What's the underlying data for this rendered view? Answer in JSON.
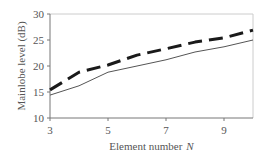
{
  "chart_data": {
    "type": "line",
    "title": "",
    "xlabel": "Element number",
    "xlabel_var": "N",
    "ylabel": "Mainlobe level (dB)",
    "xlim": [
      3,
      10
    ],
    "ylim": [
      10,
      30
    ],
    "xticks": [
      3,
      5,
      7,
      9
    ],
    "yticks": [
      10,
      15,
      20,
      25,
      30
    ],
    "grid": false,
    "legend": null,
    "x": [
      3,
      4,
      5,
      6,
      7,
      8,
      9,
      10
    ],
    "series": [
      {
        "name": "dashed",
        "style": "dashed",
        "color": "#1a1a1a",
        "width": 3,
        "values": [
          15.4,
          18.8,
          20.2,
          22.1,
          23.3,
          24.6,
          25.4,
          26.9
        ]
      },
      {
        "name": "solid",
        "style": "solid",
        "color": "#555555",
        "width": 1,
        "values": [
          14.4,
          16.2,
          18.8,
          20.0,
          21.2,
          22.7,
          23.7,
          25.0
        ]
      }
    ]
  },
  "layout": {
    "plot": {
      "left": 50,
      "right": 253,
      "top": 14,
      "bottom": 118
    }
  }
}
